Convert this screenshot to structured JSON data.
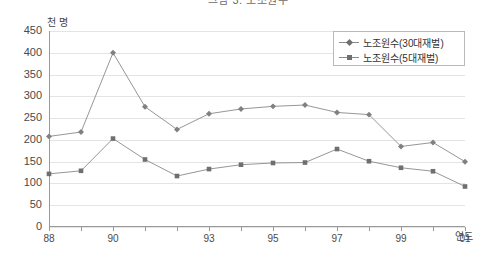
{
  "chart_data": {
    "type": "line",
    "title": "그림 3. 노조원수",
    "xlabel": "연도",
    "ylabel": "천 명",
    "ylim": [
      0,
      450
    ],
    "ytick_step": 50,
    "yticks": [
      450,
      400,
      350,
      300,
      250,
      200,
      150,
      100,
      50,
      0
    ],
    "x": [
      1988,
      1989,
      1990,
      1991,
      1992,
      1993,
      1994,
      1995,
      1996,
      1997,
      1998,
      1999,
      2000,
      2001
    ],
    "xtick_labels": [
      "88",
      "",
      "90",
      "",
      "",
      "93",
      "",
      "95",
      "",
      "97",
      "",
      "99",
      "",
      "01"
    ],
    "grid": true,
    "legend_position": "top-right",
    "series": [
      {
        "name": "노조원수(30대재벌)",
        "marker": "diamond",
        "color": "#808080",
        "values": [
          208,
          218,
          400,
          276,
          224,
          260,
          271,
          277,
          280,
          263,
          258,
          185,
          194,
          150
        ]
      },
      {
        "name": "노조원수(5대재벌)",
        "marker": "square",
        "color": "#6f6f6f",
        "values": [
          122,
          129,
          203,
          155,
          117,
          133,
          143,
          147,
          148,
          179,
          151,
          136,
          128,
          93
        ]
      }
    ]
  },
  "axis": {
    "unit_y": "천 명",
    "unit_x": "연도"
  },
  "legend": {
    "items": [
      {
        "label": "노조원수(30대재벌)"
      },
      {
        "label": "노조원수(5대재벌)"
      }
    ]
  },
  "colors": {
    "line": "#8a8a8a",
    "marker_a": "#6f6f6f",
    "marker_b": "#6f6f6f",
    "grid": "#e4e4e4",
    "axis": "#9a9a9a"
  }
}
